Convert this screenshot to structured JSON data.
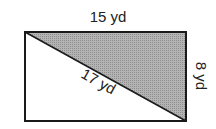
{
  "figure": {
    "shape": "rectangle",
    "shaded_region": "upper-right triangle",
    "labels": {
      "top": "15 yd",
      "right": "8 yd",
      "diagonal": "17 yd"
    },
    "colors": {
      "stroke": "#1a1a1a",
      "shade": "#a8a8a8",
      "background": "#ffffff"
    }
  }
}
